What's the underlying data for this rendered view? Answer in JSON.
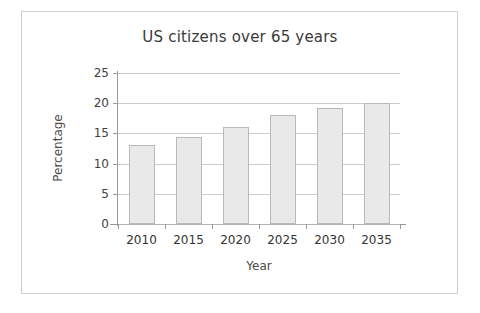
{
  "chart_data": {
    "type": "bar",
    "title": "US citizens over 65 years",
    "xlabel": "Year",
    "ylabel": "Percentage",
    "categories": [
      "2010",
      "2015",
      "2020",
      "2025",
      "2030",
      "2035"
    ],
    "values": [
      13,
      14.4,
      16,
      18,
      19.2,
      20
    ],
    "yticks": [
      "0",
      "5",
      "10",
      "15",
      "20",
      "25"
    ],
    "ytick_values": [
      0,
      5,
      10,
      15,
      20,
      25
    ],
    "ylim": [
      0,
      25
    ],
    "grid": "horizontal",
    "legend": "none",
    "bar_fill": "#e9e9e9",
    "bar_border": "#b9b9b9",
    "frame_color": "#cfcfcf"
  }
}
